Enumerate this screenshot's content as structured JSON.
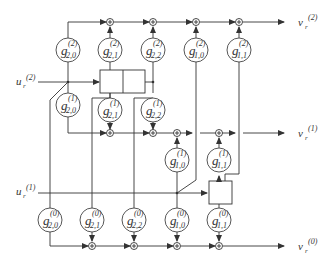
{
  "inputs": {
    "u2": {
      "base": "u",
      "sub": "r",
      "sup": "(2)"
    },
    "u1": {
      "base": "u",
      "sub": "r",
      "sup": "(1)"
    }
  },
  "outputs": {
    "v2": {
      "base": "v",
      "sub": "r",
      "sup": "(2)"
    },
    "v1": {
      "base": "v",
      "sub": "r",
      "sup": "(1)"
    },
    "v0": {
      "base": "v",
      "sub": "r",
      "sup": "(0)"
    }
  },
  "taps": {
    "g2_20": {
      "sup": "(2)",
      "sub": "2,0"
    },
    "g2_21": {
      "sup": "(2)",
      "sub": "2,1"
    },
    "g2_22": {
      "sup": "(2)",
      "sub": "2,2"
    },
    "g2_10": {
      "sup": "(2)",
      "sub": "1,0"
    },
    "g2_11": {
      "sup": "(2)",
      "sub": "1,1"
    },
    "g1_20": {
      "sup": "(1)",
      "sub": "2,0"
    },
    "g1_21": {
      "sup": "(1)",
      "sub": "2,1"
    },
    "g1_22": {
      "sup": "(1)",
      "sub": "2,2"
    },
    "g1_10": {
      "sup": "(1)",
      "sub": "1,0"
    },
    "g1_11": {
      "sup": "(1)",
      "sub": "1,1"
    },
    "g0_20": {
      "sup": "(0)",
      "sub": "2,0"
    },
    "g0_21": {
      "sup": "(0)",
      "sub": "2,1"
    },
    "g0_22": {
      "sup": "(0)",
      "sub": "2,2"
    },
    "g0_10": {
      "sup": "(0)",
      "sub": "1,0"
    },
    "g0_11": {
      "sup": "(0)",
      "sub": "1,1"
    }
  },
  "tap_symbol": "g"
}
